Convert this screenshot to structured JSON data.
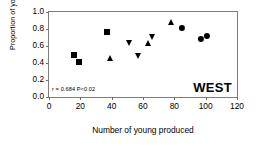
{
  "chart_data": {
    "type": "scatter",
    "title": "",
    "xlabel": "Number of young produced",
    "ylabel": "Proportion of young lost",
    "xlim": [
      0,
      120
    ],
    "ylim": [
      0.0,
      1.0
    ],
    "xticks": [
      0,
      20,
      40,
      60,
      80,
      100,
      120
    ],
    "xtick_labels": [
      "0",
      "20",
      "40",
      "60",
      "80",
      "100",
      "120"
    ],
    "yticks": [
      0.0,
      0.2,
      0.4,
      0.6,
      0.8,
      1.0
    ],
    "ytick_labels": [
      "0.0",
      "0.2",
      "0.4",
      "0.6",
      "0.8",
      "1.0"
    ],
    "grid": false,
    "legend": null,
    "panel_label": "WEST",
    "annotation": "r = 0.684  P<0.02",
    "statistics": {
      "r": 0.684,
      "p": "<0.02"
    },
    "series": [
      {
        "name": "square",
        "marker": "square",
        "color": "#000000",
        "points": [
          {
            "x": 16,
            "y": 0.5
          },
          {
            "x": 19,
            "y": 0.41
          },
          {
            "x": 37,
            "y": 0.76
          }
        ]
      },
      {
        "name": "triangle-up",
        "marker": "triangle-up",
        "color": "#000000",
        "points": [
          {
            "x": 39,
            "y": 0.46
          },
          {
            "x": 63,
            "y": 0.63
          },
          {
            "x": 78,
            "y": 0.88
          }
        ]
      },
      {
        "name": "triangle-down",
        "marker": "triangle-down",
        "color": "#000000",
        "points": [
          {
            "x": 51,
            "y": 0.63
          },
          {
            "x": 57,
            "y": 0.485
          },
          {
            "x": 66,
            "y": 0.705
          }
        ]
      },
      {
        "name": "circle",
        "marker": "circle",
        "color": "#000000",
        "points": [
          {
            "x": 85,
            "y": 0.815
          },
          {
            "x": 97,
            "y": 0.685
          },
          {
            "x": 101,
            "y": 0.715
          }
        ]
      }
    ]
  }
}
